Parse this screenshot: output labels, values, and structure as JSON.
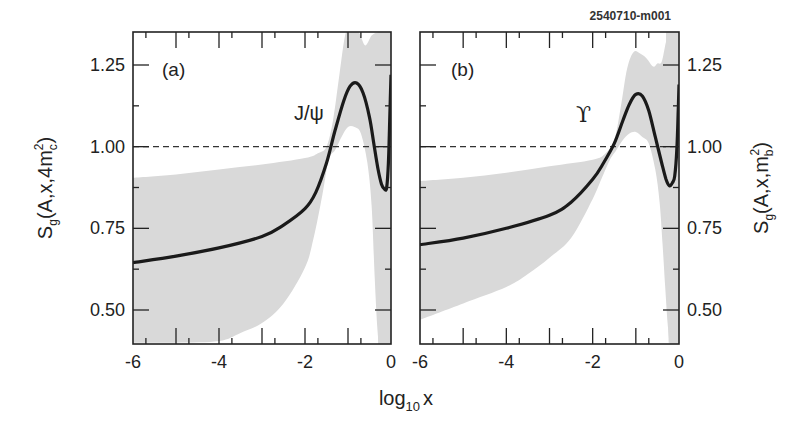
{
  "figure_id": "2540710-m001",
  "xlabel": {
    "main": "log",
    "sub": "10",
    "tail": "x"
  },
  "colors": {
    "band": "#d9d9d9",
    "curve": "#1a1a1a",
    "axis": "#222222",
    "reference": "#333333"
  },
  "chart_data": [
    {
      "type": "line",
      "panel": "(a)",
      "annotation": "J/ψ",
      "title": "",
      "xlabel": "log10 x",
      "ylabel": "S_g(A,x,4m_c^2)",
      "ylabel_parts": {
        "s": "S",
        "s_sub": "g",
        "args": "(A,x,4m",
        "m_sub": "c",
        "m_sup": "2",
        "close": ")"
      },
      "xlim": [
        -6,
        0
      ],
      "ylim": [
        0.4,
        1.35
      ],
      "xticks": [
        -6,
        -4,
        -2,
        0
      ],
      "yticks": [
        0.5,
        0.75,
        1.0,
        1.25
      ],
      "ytick_labels": [
        "0.50",
        "0.75",
        "1.00",
        "1.25"
      ],
      "yaxis_side": "left",
      "reference_line": {
        "y": 1.0,
        "style": "dashed"
      },
      "series": [
        {
          "name": "central",
          "x": [
            -6,
            -5,
            -4,
            -3,
            -2.5,
            -2,
            -1.75,
            -1.5,
            -1.3,
            -1.1,
            -0.95,
            -0.8,
            -0.65,
            -0.5,
            -0.4,
            -0.3,
            -0.22,
            -0.15,
            -0.1,
            -0.06,
            -0.03,
            0
          ],
          "y": [
            0.645,
            0.665,
            0.69,
            0.725,
            0.76,
            0.81,
            0.86,
            0.95,
            1.05,
            1.14,
            1.185,
            1.195,
            1.165,
            1.09,
            1.01,
            0.93,
            0.885,
            0.87,
            0.875,
            0.95,
            1.08,
            1.22
          ]
        },
        {
          "name": "uncertainty-band-upper",
          "x": [
            -6,
            -5,
            -4,
            -3,
            -2,
            -1.7,
            -1.5,
            -1.35,
            -1.2,
            -1.05,
            -0.9,
            -0.75,
            -0.6,
            -0.45,
            -0.3,
            -0.15,
            0
          ],
          "y": [
            0.905,
            0.915,
            0.93,
            0.945,
            0.965,
            0.98,
            1.0,
            1.08,
            1.22,
            1.35,
            1.35,
            1.35,
            1.31,
            1.34,
            1.35,
            1.35,
            1.35
          ]
        },
        {
          "name": "uncertainty-band-lower",
          "x": [
            -6,
            -5,
            -4,
            -3.5,
            -3,
            -2.5,
            -2,
            -1.8,
            -1.6,
            -1.45,
            -1.3,
            -1.15,
            -1.0,
            -0.85,
            -0.7,
            -0.55,
            -0.45,
            -0.38,
            -0.32,
            -0.28,
            -0.2,
            -0.15
          ],
          "y": [
            0.4,
            0.4,
            0.405,
            0.43,
            0.46,
            0.52,
            0.63,
            0.72,
            0.85,
            0.96,
            0.99,
            1.03,
            1.06,
            1.06,
            1.04,
            0.95,
            0.82,
            0.6,
            0.45,
            0.4,
            0.4,
            0.4
          ]
        }
      ],
      "band_tail": {
        "x": [
          -0.28,
          -0.2,
          -0.15,
          -0.1,
          -0.05,
          0
        ],
        "upper": [
          1.35,
          1.35,
          1.35,
          1.35,
          1.35,
          1.35
        ],
        "lower": [
          0.4,
          0.4,
          0.4,
          0.4,
          0.4,
          0.4
        ]
      }
    },
    {
      "type": "line",
      "panel": "(b)",
      "annotation": "ϒ",
      "title": "",
      "xlabel": "log10 x",
      "ylabel": "S_g(A,x,m_b^2)",
      "ylabel_parts": {
        "s": "S",
        "s_sub": "g",
        "args": "(A,x,m",
        "m_sub": "b",
        "m_sup": "2",
        "close": ")"
      },
      "xlim": [
        -6,
        0
      ],
      "ylim": [
        0.4,
        1.35
      ],
      "xticks": [
        -6,
        -4,
        -2,
        0
      ],
      "yticks": [
        0.5,
        0.75,
        1.0,
        1.25
      ],
      "ytick_labels": [
        "0.50",
        "0.75",
        "1.00",
        "1.25"
      ],
      "yaxis_side": "right",
      "reference_line": {
        "y": 1.0,
        "style": "dashed"
      },
      "series": [
        {
          "name": "central",
          "x": [
            -6,
            -5,
            -4,
            -3,
            -2.5,
            -2,
            -1.75,
            -1.5,
            -1.3,
            -1.15,
            -1.0,
            -0.85,
            -0.7,
            -0.55,
            -0.4,
            -0.3,
            -0.22,
            -0.15,
            -0.1,
            -0.05,
            -0.02,
            0
          ],
          "y": [
            0.7,
            0.72,
            0.75,
            0.79,
            0.83,
            0.9,
            0.95,
            1.01,
            1.08,
            1.13,
            1.16,
            1.155,
            1.11,
            1.03,
            0.95,
            0.9,
            0.88,
            0.89,
            0.91,
            0.99,
            1.1,
            1.19
          ]
        },
        {
          "name": "uncertainty-band-upper",
          "x": [
            -6,
            -5,
            -4,
            -3,
            -2,
            -1.7,
            -1.5,
            -1.35,
            -1.2,
            -1.05,
            -0.9,
            -0.75,
            -0.6,
            -0.5,
            -0.4,
            -0.3,
            -0.2,
            -0.1,
            0
          ],
          "y": [
            0.895,
            0.905,
            0.92,
            0.94,
            0.96,
            0.98,
            1.02,
            1.12,
            1.24,
            1.29,
            1.285,
            1.27,
            1.245,
            1.255,
            1.26,
            1.32,
            1.35,
            1.35,
            1.35
          ]
        },
        {
          "name": "uncertainty-band-lower",
          "x": [
            -6,
            -5,
            -4,
            -3.5,
            -3,
            -2.5,
            -2,
            -1.8,
            -1.6,
            -1.45,
            -1.3,
            -1.15,
            -1.0,
            -0.85,
            -0.7,
            -0.55,
            -0.45,
            -0.38,
            -0.32,
            -0.27,
            -0.22
          ],
          "y": [
            0.47,
            0.52,
            0.57,
            0.61,
            0.66,
            0.72,
            0.84,
            0.9,
            0.96,
            0.99,
            1.02,
            1.04,
            1.045,
            1.03,
            1.01,
            0.93,
            0.83,
            0.7,
            0.57,
            0.47,
            0.4
          ]
        }
      ],
      "band_tail": {
        "x": [
          -0.22,
          -0.18,
          -0.14,
          -0.1,
          -0.05,
          0
        ],
        "upper": [
          1.35,
          1.35,
          1.35,
          1.35,
          1.35,
          1.35
        ],
        "lower": [
          0.4,
          0.5,
          0.62,
          0.8,
          0.95,
          1.05
        ]
      }
    }
  ]
}
